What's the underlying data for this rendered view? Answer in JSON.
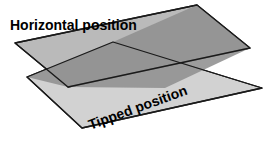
{
  "figure": {
    "background_color": "#ffffff",
    "width": 274,
    "height": 148
  },
  "labels": {
    "horizontal": "Horizontal position",
    "tipped": "Tipped position"
  },
  "colors": {
    "plane_upper_fill": "#a8a8a8",
    "plane_lower_fill": "#c9c9c9",
    "plane_light_fill": "#d6d6d6",
    "overlap_fill": "#8e8e8e",
    "outline": "#1a1a1a",
    "text": "#000000"
  },
  "shapes": {
    "horizontal_plane": {
      "name": "horizontal-plane",
      "points": "15,43 197,5 250,48 68,87",
      "fill": "#b5b5b5"
    },
    "tipped_plane": {
      "name": "tipped-plane",
      "points": "27,77 113,42 262,88 82,128",
      "fill": "#d2d2d2"
    },
    "overlap_region": {
      "name": "overlap-region",
      "points": "113,42 197,5 250,48 165,88 68,87 27,77",
      "fill": "#8f8f8f"
    }
  },
  "geometry_notes": {
    "intersection_left": "113,42",
    "intersection_right": "165,88",
    "projection": "isometric-like oblique"
  }
}
